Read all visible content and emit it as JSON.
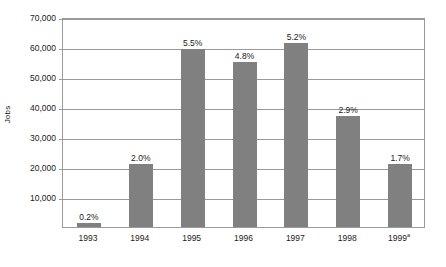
{
  "chart_data": {
    "type": "bar",
    "title": "",
    "xlabel": "",
    "ylabel": "Jobs",
    "categories": [
      "1993",
      "1994",
      "1995",
      "1996",
      "1997",
      "1998",
      "1999"
    ],
    "values": [
      1500,
      21000,
      59500,
      55000,
      61500,
      37000,
      21000
    ],
    "data_labels": [
      "0.2%",
      "2.0%",
      "5.5%",
      "4.8%",
      "5.2%",
      "2.9%",
      "1.7%"
    ],
    "category_footnotes": [
      "",
      "",
      "",
      "",
      "",
      "",
      "a"
    ],
    "ylim": [
      0,
      70000
    ],
    "ytick_values": [
      10000,
      20000,
      30000,
      40000,
      50000,
      60000,
      70000
    ],
    "ytick_labels": [
      "10,000",
      "20,000",
      "30,000",
      "40,000",
      "50,000",
      "60,000",
      "70,000"
    ],
    "grid": "horizontal",
    "legend": "none",
    "bar_color": "#808080",
    "axis_color": "#9a9a9a",
    "background_color": "#ffffff"
  }
}
